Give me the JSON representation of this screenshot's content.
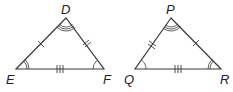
{
  "diagram": {
    "type": "congruent-triangles",
    "triangles": [
      {
        "name": "DEF",
        "vertices": [
          {
            "label": "D",
            "x": 66,
            "y": 18
          },
          {
            "label": "E",
            "x": 16,
            "y": 69
          },
          {
            "label": "F",
            "x": 104,
            "y": 69
          }
        ],
        "side_marks": {
          "DE": 1,
          "DF": 2,
          "EF": 3
        },
        "angle_marks": {
          "D": 3,
          "E": 2,
          "F": 1
        }
      },
      {
        "name": "PQR",
        "vertices": [
          {
            "label": "P",
            "x": 171,
            "y": 18
          },
          {
            "label": "Q",
            "x": 135,
            "y": 69
          },
          {
            "label": "R",
            "x": 221,
            "y": 69
          }
        ],
        "side_marks": {
          "PQ": 2,
          "PR": 1,
          "QR": 3
        },
        "angle_marks": {
          "P": 3,
          "Q": 1,
          "R": 2
        }
      }
    ],
    "labels": {
      "D": "D",
      "E": "E",
      "F": "F",
      "P": "P",
      "Q": "Q",
      "R": "R"
    },
    "stroke_color": "#3a3a3a"
  }
}
